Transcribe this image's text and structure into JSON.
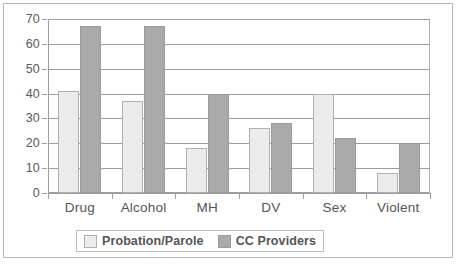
{
  "chart_data": {
    "type": "bar",
    "title": "",
    "xlabel": "",
    "ylabel": "",
    "categories": [
      "Drug",
      "Alcohol",
      "MH",
      "DV",
      "Sex",
      "Violent"
    ],
    "series": [
      {
        "name": "Probation/Parole",
        "color": "#ececec",
        "values": [
          41,
          37,
          18,
          26,
          40,
          8
        ]
      },
      {
        "name": "CC Providers",
        "color": "#aaaaaa",
        "values": [
          67,
          67,
          40,
          28,
          22,
          20
        ]
      }
    ],
    "ylim": [
      0,
      70
    ],
    "yticks": [
      0,
      10,
      20,
      30,
      40,
      50,
      60,
      70
    ],
    "ytick_labels": [
      "0",
      "10",
      "20",
      "30",
      "40",
      "50",
      "60",
      "70"
    ],
    "grid": true,
    "legend_position": "bottom"
  }
}
